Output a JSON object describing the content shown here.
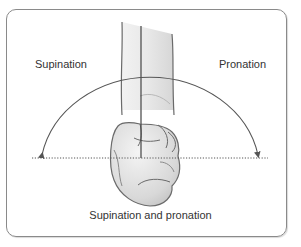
{
  "figure": {
    "labels": {
      "left": "Supination",
      "right": "Pronation"
    },
    "caption": "Supination and pronation",
    "colors": {
      "frame": "#8a8a8a",
      "line": "#555555",
      "skin_fill": "#e4e4e4",
      "skin_outline": "#6a6a6a",
      "text": "#333333"
    },
    "elements": [
      "forearm-outline",
      "vertical-reference-line",
      "rotation-arc-with-two-arrowheads",
      "dotted-horizontal-baseline",
      "clenched-fist"
    ]
  }
}
